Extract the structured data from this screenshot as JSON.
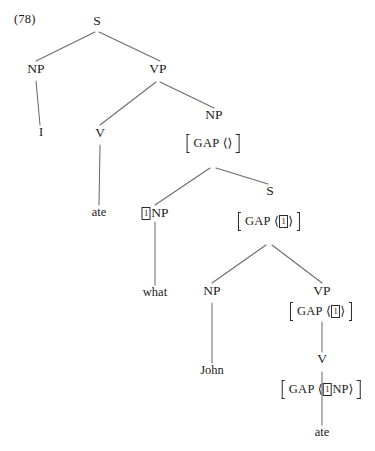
{
  "figure": {
    "example_number": "(78)",
    "type": "syntax-tree"
  },
  "labels": {
    "feature_gap": "GAP",
    "angle_open": "⟨",
    "angle_close": "⟩",
    "tag_one": "1"
  },
  "nodes": {
    "root_s": "S",
    "subject_np": "NP",
    "subject_terminal": "I",
    "matrix_vp": "VP",
    "matrix_v": "V",
    "matrix_v_terminal": "ate",
    "object_np": "NP",
    "filler_np": "NP",
    "filler_terminal": "what",
    "embedded_s": "S",
    "embedded_np": "NP",
    "embedded_np_terminal": "John",
    "embedded_vp": "VP",
    "embedded_v": "V",
    "embedded_v_terminal": "ate",
    "gap_np_category": "NP"
  },
  "gap_values": {
    "object_np_gap": "empty-list",
    "embedded_s_gap": "tag-1",
    "embedded_vp_gap": "tag-1",
    "embedded_v_gap": "tag-1-np"
  },
  "colors": {
    "ink": "#1a1a1a",
    "line": "#5a5a5a",
    "background": "#ffffff"
  }
}
